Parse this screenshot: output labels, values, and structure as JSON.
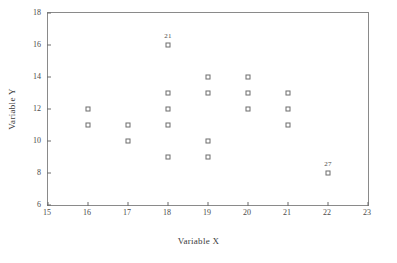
{
  "chart_data": {
    "type": "scatter",
    "title": "",
    "xlabel": "Variable X",
    "ylabel": "Variable Y",
    "xlim": [
      15,
      23
    ],
    "ylim": [
      6,
      18
    ],
    "xticks": [
      15,
      16,
      17,
      18,
      19,
      20,
      21,
      22,
      23
    ],
    "yticks": [
      6,
      8,
      10,
      12,
      14,
      16,
      18
    ],
    "xticklabels": [
      "15",
      "16",
      "17",
      "18",
      "19",
      "20",
      "21",
      "22",
      "23"
    ],
    "yticklabels": [
      "6",
      "8",
      "10",
      "12",
      "14",
      "16",
      "18"
    ],
    "grid": false,
    "legend": false,
    "marker": "open-square",
    "marker_color": "#6d6d6d",
    "frame_color": "#8a8a8a",
    "series": [
      {
        "name": "observations",
        "points": [
          {
            "x": 16,
            "y": 12,
            "label": ""
          },
          {
            "x": 16,
            "y": 11,
            "label": ""
          },
          {
            "x": 17,
            "y": 11,
            "label": ""
          },
          {
            "x": 17,
            "y": 10,
            "label": ""
          },
          {
            "x": 18,
            "y": 16,
            "label": "21"
          },
          {
            "x": 18,
            "y": 13,
            "label": ""
          },
          {
            "x": 18,
            "y": 12,
            "label": ""
          },
          {
            "x": 18,
            "y": 11,
            "label": ""
          },
          {
            "x": 18,
            "y": 9,
            "label": ""
          },
          {
            "x": 19,
            "y": 14,
            "label": ""
          },
          {
            "x": 19,
            "y": 13,
            "label": ""
          },
          {
            "x": 19,
            "y": 10,
            "label": ""
          },
          {
            "x": 19,
            "y": 9,
            "label": ""
          },
          {
            "x": 20,
            "y": 14,
            "label": ""
          },
          {
            "x": 20,
            "y": 13,
            "label": ""
          },
          {
            "x": 20,
            "y": 12,
            "label": ""
          },
          {
            "x": 21,
            "y": 13,
            "label": ""
          },
          {
            "x": 21,
            "y": 12,
            "label": ""
          },
          {
            "x": 21,
            "y": 11,
            "label": ""
          },
          {
            "x": 22,
            "y": 8,
            "label": "27"
          }
        ]
      }
    ],
    "annotations": [
      {
        "text": "21",
        "x": 18,
        "y": 16
      },
      {
        "text": "27",
        "x": 22,
        "y": 8
      }
    ]
  }
}
